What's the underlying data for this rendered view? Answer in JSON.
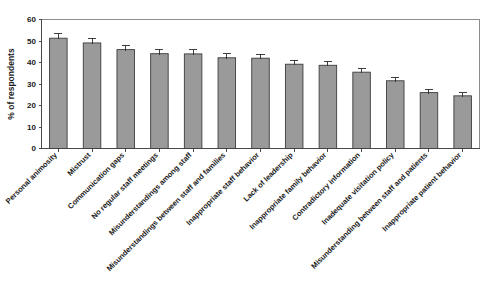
{
  "chart_data": {
    "type": "bar",
    "title": "",
    "subtitle": "",
    "xlabel": "",
    "ylabel": "% of respondents",
    "ylim": [
      0,
      60
    ],
    "yticks": [
      0,
      10,
      20,
      30,
      40,
      50,
      60
    ],
    "grid": false,
    "legend": null,
    "orientation": "vertical",
    "bar_color": "#9a9a9a",
    "bar_edge_color": "#3d3d3d",
    "error_bars": true,
    "categories": [
      "Personal animosity",
      "Mistrust",
      "Communication gaps",
      "No regular staff meetings",
      "Misunderstandings among staff",
      "Misunderstandings between staff and families",
      "Inappropriate staff behavior",
      "Lack of leadership",
      "Inappropriate family behavior",
      "Contradictory information",
      "Inadequate visitation policy",
      "Misunderstanding between staff and patients",
      "Inappropriate patient behavior"
    ],
    "values": [
      51.3,
      49.1,
      46.0,
      44.1,
      44.0,
      42.2,
      42.0,
      39.2,
      38.7,
      35.5,
      31.5,
      26.0,
      24.5
    ],
    "errors": [
      2.2,
      2.2,
      2.0,
      2.0,
      2.0,
      1.9,
      1.9,
      1.8,
      1.8,
      1.7,
      1.6,
      1.5,
      1.4
    ]
  },
  "axis": {
    "y_tick_labels": [
      "0",
      "10",
      "20",
      "30",
      "40",
      "50",
      "60"
    ],
    "y_axis_title": "% of respondents"
  }
}
